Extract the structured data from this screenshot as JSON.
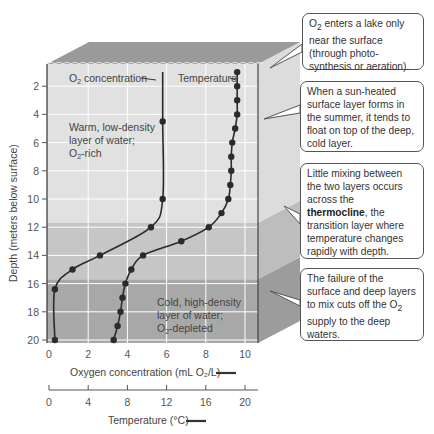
{
  "chart_data": {
    "type": "line",
    "title": "",
    "ylabel": "Depth (meters below surface)",
    "xlabel": "Oxygen concentration (mL O2/L)",
    "xlabel_secondary": "Temperature (°C)",
    "y_ticks": [
      2,
      4,
      6,
      8,
      10,
      12,
      14,
      16,
      18,
      20
    ],
    "x_ticks_oxygen": [
      0,
      2,
      4,
      6,
      8,
      10
    ],
    "x_ticks_temperature": [
      0,
      4,
      8,
      12,
      16,
      20
    ],
    "ylim": [
      0,
      20
    ],
    "xlim_oxygen": [
      0,
      10.5
    ],
    "xlim_temperature": [
      0,
      21
    ],
    "y_inverted": true,
    "grid": true,
    "series": [
      {
        "name": "O2 concentration",
        "axis": "oxygen",
        "points": [
          {
            "depth": 1,
            "value": 5.8
          },
          {
            "depth": 4.5,
            "value": 5.8
          },
          {
            "depth": 10,
            "value": 5.8
          },
          {
            "depth": 12,
            "value": 5.2
          },
          {
            "depth": 14,
            "value": 2.6
          },
          {
            "depth": 15,
            "value": 1.2
          },
          {
            "depth": 16.4,
            "value": 0.3
          },
          {
            "depth": 20,
            "value": 0.3
          }
        ],
        "markers_at_depths": [
          4.5,
          10,
          12,
          14,
          15,
          16.4,
          20
        ]
      },
      {
        "name": "Temperature",
        "axis": "temperature",
        "points": [
          {
            "depth": 1,
            "value": 19.2
          },
          {
            "depth": 2,
            "value": 19.2
          },
          {
            "depth": 3,
            "value": 19.2
          },
          {
            "depth": 4,
            "value": 19.2
          },
          {
            "depth": 5,
            "value": 19.0
          },
          {
            "depth": 6,
            "value": 18.7
          },
          {
            "depth": 7,
            "value": 18.6
          },
          {
            "depth": 8,
            "value": 18.6
          },
          {
            "depth": 9,
            "value": 18.5
          },
          {
            "depth": 10,
            "value": 18.3
          },
          {
            "depth": 11,
            "value": 17.6
          },
          {
            "depth": 12,
            "value": 16.3
          },
          {
            "depth": 13,
            "value": 13.5
          },
          {
            "depth": 14,
            "value": 9.6
          },
          {
            "depth": 15,
            "value": 8.4
          },
          {
            "depth": 16,
            "value": 7.8
          },
          {
            "depth": 17,
            "value": 7.5
          },
          {
            "depth": 18,
            "value": 7.3
          },
          {
            "depth": 19,
            "value": 7.0
          },
          {
            "depth": 20,
            "value": 6.6
          }
        ]
      }
    ],
    "layers": [
      {
        "name": "epilimnion",
        "from_depth": 0,
        "to_depth": 11.7,
        "color": "#e1e1e1"
      },
      {
        "name": "thermocline",
        "from_depth": 11.7,
        "to_depth": 15.7,
        "color": "#c6c6c6"
      },
      {
        "name": "hypolimnion",
        "from_depth": 15.7,
        "to_depth": 20,
        "color": "#a8a8a8"
      }
    ],
    "series_labels": {
      "oxygen": "O₂ concentration",
      "temperature": "Temperature"
    },
    "annotations": {
      "warm_layer": [
        "Warm, low-density",
        "layer of water;",
        "O₂-rich"
      ],
      "cold_layer": [
        "Cold, high-density",
        "layer of water;",
        "O₂-depleted"
      ]
    },
    "legend": {
      "oxygen_axis_title": "Oxygen concentration (mL O₂/L)",
      "temperature_axis_title": "Temperature (°C)"
    }
  },
  "callouts": [
    {
      "id": "o2-enters",
      "html": "O<sub>2</sub> enters a lake only near the surface (through photo-synthesis or aeration)."
    },
    {
      "id": "sun-heated",
      "text": "When a sun-heated surface layer forms in the summer, it tends to float on top of the deep, cold layer."
    },
    {
      "id": "thermocline",
      "pre": "Little mixing between the two layers occurs across the ",
      "bold": "thermocline",
      "post": ", the transition layer where temperature changes rapidly with depth."
    },
    {
      "id": "failure",
      "html": "The failure of the surface and deep layers to mix cuts off the O<sub>2</sub> supply to the deep waters."
    }
  ],
  "colors": {
    "line": "#2b2b2b",
    "grid": "#ffffff",
    "box_top": "#9a9a9a",
    "side_light": "#d8d8d8"
  }
}
